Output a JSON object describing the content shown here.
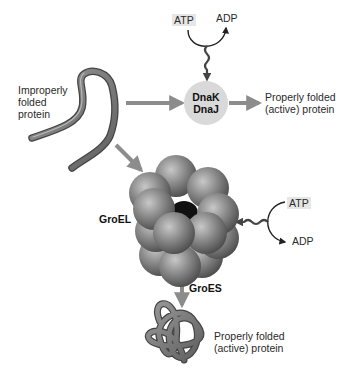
{
  "diagram": {
    "nodes": {
      "improper": {
        "line1": "Improperly",
        "line2": "folded",
        "line3": "protein"
      },
      "dnak": {
        "line1": "DnaK",
        "line2": "DnaJ"
      },
      "product_top": {
        "line1": "Properly folded",
        "line2": "(active) protein"
      },
      "groel": {
        "label": "GroEL"
      },
      "groes": {
        "label": "GroES"
      },
      "product_bottom": {
        "line1": "Properly folded",
        "line2": "(active) protein"
      }
    },
    "energy_top": {
      "atp": "ATP",
      "adp": "ADP"
    },
    "energy_side": {
      "atp": "ATP",
      "adp": "ADP"
    },
    "edges": [
      {
        "from": "improper",
        "to": "dnak"
      },
      {
        "from": "dnak",
        "to": "product_top"
      },
      {
        "from": "improper",
        "to": "groel"
      },
      {
        "from": "groel",
        "to": "product_bottom",
        "label": "GroES"
      },
      {
        "from": "energy_top",
        "to": "dnak"
      },
      {
        "from": "energy_side",
        "to": "groel"
      }
    ],
    "colors": {
      "arrow": "#8c8c8c",
      "node_fill": "#d9d9d9",
      "protein": "#7a7a7a",
      "sphere": "#8a8a8a",
      "chip": "#e6e6e6"
    }
  }
}
